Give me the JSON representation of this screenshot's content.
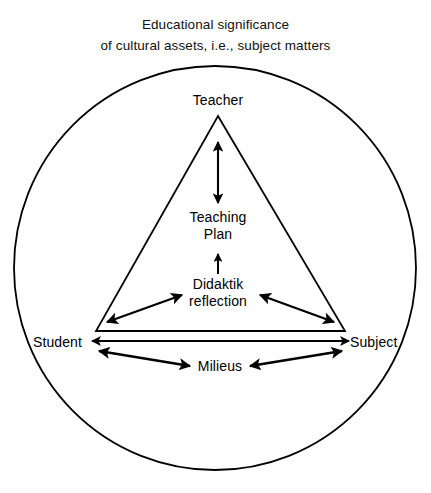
{
  "title": {
    "line1": "Educational significance",
    "line2": "of cultural assets, i.e., subject matters"
  },
  "diagram": {
    "type": "triangle-in-circle",
    "shapes": {
      "outer_circle": {
        "cx": 215,
        "cy": 268,
        "r": 201
      },
      "triangle": {
        "apex": {
          "x": 218,
          "y": 116
        },
        "bottom_left": {
          "x": 96,
          "y": 331
        },
        "bottom_right": {
          "x": 345,
          "y": 331
        }
      }
    },
    "nodes": {
      "teacher": {
        "label": "Teacher",
        "x": 218,
        "y": 92
      },
      "student": {
        "label": "Student",
        "x": 33,
        "y": 335
      },
      "subject": {
        "label": "Subject",
        "x": 348,
        "y": 335
      },
      "teaching_plan": {
        "label_line1": "Teaching",
        "label_line2": "Plan",
        "x": 218,
        "y": 212
      },
      "didaktik_reflection": {
        "label_line1": "Didaktik",
        "label_line2": "reflection",
        "x": 218,
        "y": 279
      },
      "milieus": {
        "label": "Milieus",
        "x": 218,
        "y": 365
      }
    },
    "connectors": [
      {
        "name": "teacher-to-teaching-plan",
        "from": "teacher",
        "to": "teaching_plan",
        "heads": "both",
        "orientation": "vertical"
      },
      {
        "name": "didaktik-to-teaching-plan",
        "from": "didaktik_reflection",
        "to": "teaching_plan",
        "heads": "single-up",
        "orientation": "vertical"
      },
      {
        "name": "student-to-didaktik-reflection",
        "from": "student",
        "to": "didaktik_reflection",
        "heads": "both",
        "orientation": "diagonal"
      },
      {
        "name": "subject-to-didaktik-reflection",
        "from": "subject",
        "to": "didaktik_reflection",
        "heads": "both",
        "orientation": "diagonal"
      },
      {
        "name": "student-to-subject",
        "from": "student",
        "to": "subject",
        "heads": "both",
        "orientation": "horizontal"
      },
      {
        "name": "student-to-milieus",
        "from": "student",
        "to": "milieus",
        "heads": "both",
        "orientation": "diagonal"
      },
      {
        "name": "subject-to-milieus",
        "from": "subject",
        "to": "milieus",
        "heads": "both",
        "orientation": "diagonal"
      }
    ],
    "colors": {
      "stroke": "#000000",
      "background": "#ffffff",
      "text": "#000000"
    }
  }
}
